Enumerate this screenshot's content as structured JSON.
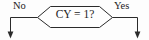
{
  "diagram": {
    "type": "flowchart-fragment",
    "background_color": "#fdfdfd",
    "stroke_color": "#2b2b2b",
    "text_color": "#1c1c1c",
    "decision": {
      "shape": "hexagon",
      "condition_text": "CY = 1?"
    },
    "branches": [
      {
        "label": "No",
        "direction": "left-down",
        "terminator": "arrowhead-down"
      },
      {
        "label": "Yes",
        "direction": "right-down",
        "terminator": "arrowhead-down"
      }
    ]
  }
}
